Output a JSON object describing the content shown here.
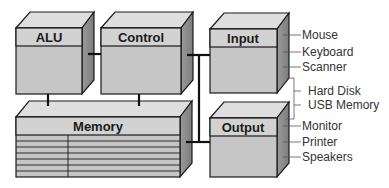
{
  "diagram": {
    "colors": {
      "front": "#c4c4c4",
      "header": "#d4d4d4",
      "top": "#dedede",
      "side": "#8f8f8f",
      "stroke": "#1a1a1a",
      "label": "#333333"
    },
    "blocks": {
      "alu": {
        "label": "ALU"
      },
      "control": {
        "label": "Control"
      },
      "input": {
        "label": "Input"
      },
      "memory": {
        "label": "Memory"
      },
      "output": {
        "label": "Output"
      }
    },
    "input_devices": [
      "Mouse",
      "Keyboard",
      "Scanner"
    ],
    "storage_devices": [
      "Hard Disk",
      "USB Memory"
    ],
    "output_devices": [
      "Monitor",
      "Printer",
      "Speakers"
    ]
  }
}
